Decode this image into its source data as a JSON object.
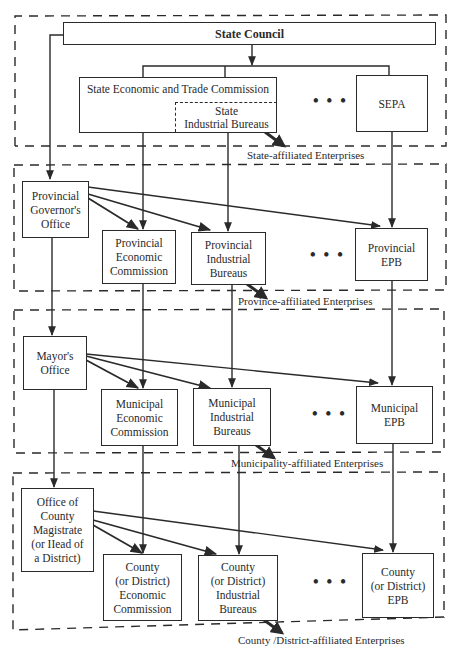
{
  "diagram": {
    "type": "organizational-hierarchy",
    "levels": [
      {
        "name": "state",
        "enterprises_label": "State-affiliated Enterprises",
        "nodes": {
          "head": "State Council",
          "economic": "State Economic and Trade Commission",
          "industrial": "State\nIndustrial Bureaus",
          "epb": "SEPA"
        }
      },
      {
        "name": "province",
        "enterprises_label": "Province-affiliated Enterprises",
        "nodes": {
          "head": "Provincial\nGovernor's\nOffice",
          "economic": "Provincial\nEconomic\nCommission",
          "industrial": "Provincial\nIndustrial\nBureaus",
          "epb": "Provincial\nEPB"
        }
      },
      {
        "name": "municipality",
        "enterprises_label": "Municipality-affiliated Enterprises",
        "nodes": {
          "head": "Mayor's\nOffice",
          "economic": "Municipal\nEconomic\nCommission",
          "industrial": "Municipal\nIndustrial\nBureaus",
          "epb": "Municipal\nEPB"
        }
      },
      {
        "name": "county",
        "enterprises_label": "County /District-affiliated Enterprises",
        "nodes": {
          "head": "Office of\nCounty\nMagistrate\n(or IIead of\na District)",
          "economic": "County\n(or District)\nEconomic\nCommission",
          "industrial": "County\n(or District)\nIndustrial\nBureaus",
          "epb": "County\n(or District)\nEPB"
        }
      }
    ],
    "ellipsis": "• • •",
    "colors": {
      "line": "#2a2a2a",
      "background": "#ffffff"
    }
  }
}
